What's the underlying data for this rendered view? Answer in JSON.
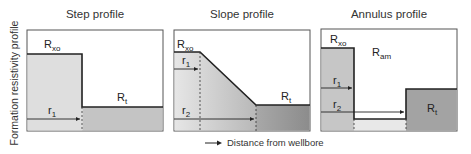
{
  "y_axis_label": "Formation resistivity profile",
  "x_legend": "Distance from wellbore",
  "panels": [
    {
      "title": "Step profile",
      "labels": {
        "rxo": "R",
        "rxo_sub": "xo",
        "rt": "R",
        "rt_sub": "t",
        "r1": "r",
        "r1_sub": "1"
      }
    },
    {
      "title": "Slope profile",
      "labels": {
        "rxo": "R",
        "rxo_sub": "xo",
        "rt": "R",
        "rt_sub": "t",
        "r1": "r",
        "r1_sub": "1",
        "r2": "r",
        "r2_sub": "2"
      }
    },
    {
      "title": "Annulus profile",
      "labels": {
        "rxo": "R",
        "rxo_sub": "xo",
        "ram": "R",
        "ram_sub": "am",
        "rt": "R",
        "rt_sub": "t",
        "r1": "r",
        "r1_sub": "1",
        "r2": "r",
        "r2_sub": "2"
      }
    }
  ],
  "colors": {
    "frame": "#555555",
    "profile_line": "#222222",
    "light_fill": "#d9d9d9",
    "mid_fill": "#b5b5b5",
    "dark_fill": "#9a9a9a"
  }
}
